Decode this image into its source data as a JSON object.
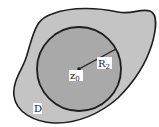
{
  "diagram": {
    "region_label": "D",
    "center_label_base": "z",
    "center_label_sub": "0",
    "radius_label_base": "R",
    "radius_label_sub": "2",
    "colors": {
      "background": "#ffffff",
      "region_fill": "#c4c4c4",
      "disk_fill": "#a9a9a9",
      "stroke": "#1e1e1e",
      "label_bg": "#ffffff"
    },
    "disk": {
      "cx": 79,
      "cy": 69,
      "r": 42
    },
    "center_point": {
      "x": 79,
      "y": 69
    },
    "radius_endpoint": {
      "x": 116,
      "y": 49
    }
  }
}
